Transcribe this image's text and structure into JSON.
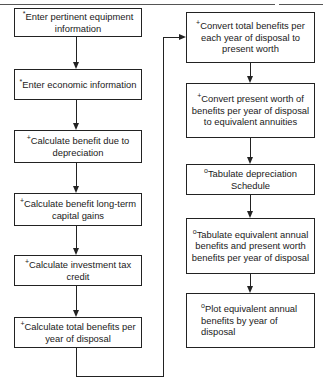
{
  "diagram": {
    "type": "flowchart",
    "legend_marks": {
      "asterisk": "*",
      "plus": "+",
      "circle": "o"
    },
    "left_column": [
      {
        "mark": "*",
        "text": "Enter pertinent equipment information"
      },
      {
        "mark": "*",
        "text": "Enter economic information"
      },
      {
        "mark": "+",
        "text": "Calculate benefit due to depreciation"
      },
      {
        "mark": "+",
        "text": "Calculate benefit long-term capital gains"
      },
      {
        "mark": "+",
        "text": "Calculate investment tax credit"
      },
      {
        "mark": "+",
        "text": "Calculate total benefits per year of disposal"
      }
    ],
    "right_column": [
      {
        "mark": "+",
        "text": "Convert total benefits per each year of disposal to present worth"
      },
      {
        "mark": "+",
        "text": "Convert present worth of benefits per year of disposal to equivalent annuities"
      },
      {
        "mark": "o",
        "text": "Tabulate depreciation Schedule"
      },
      {
        "mark": "o",
        "text": "Tabulate equivalent annual benefits and present worth benefits per year of disposal"
      },
      {
        "mark": "o",
        "text": "Plot equivalent annual benefits by year of disposal"
      }
    ],
    "edges": [
      [
        "L1",
        "L2"
      ],
      [
        "L2",
        "L3"
      ],
      [
        "L3",
        "L4"
      ],
      [
        "L4",
        "L5"
      ],
      [
        "L5",
        "L6"
      ],
      [
        "L6",
        "R1"
      ],
      [
        "R1",
        "R2"
      ],
      [
        "R2",
        "R3"
      ],
      [
        "R3",
        "R4"
      ],
      [
        "R4",
        "R5"
      ]
    ]
  }
}
